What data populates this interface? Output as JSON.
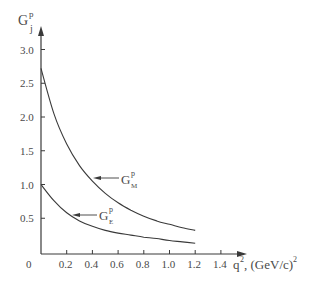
{
  "chart_data": {
    "type": "line",
    "title": "",
    "ylabel": "G_j^p",
    "ylabel_parts": {
      "base": "G",
      "sup": "p",
      "sub": "j"
    },
    "xlabel": "q², (GeV/c)²",
    "xlabel_parts": {
      "main": "q",
      "sup1": "2",
      "rest": ", (GeV/c)",
      "sup2": "2"
    },
    "xlim": [
      0,
      1.5
    ],
    "ylim": [
      0,
      3.2
    ],
    "grid": false,
    "legend": "inline arrow labels",
    "x_ticks": [
      "0",
      "0.2",
      "0.4",
      "0.6",
      "0.8",
      "1.0",
      "1.2",
      "1.4"
    ],
    "y_ticks": [
      "0.5",
      "1.0",
      "1.5",
      "2.0",
      "2.5",
      "3.0"
    ],
    "series": [
      {
        "name": "G_M^p",
        "label_parts": {
          "base": "G",
          "sup": "p",
          "sub": "M"
        },
        "x": [
          0,
          0.1,
          0.2,
          0.3,
          0.4,
          0.5,
          0.6,
          0.7,
          0.8,
          0.9,
          1.0,
          1.1,
          1.2
        ],
        "values": [
          2.72,
          2.05,
          1.6,
          1.28,
          1.05,
          0.87,
          0.73,
          0.62,
          0.53,
          0.46,
          0.41,
          0.36,
          0.32
        ]
      },
      {
        "name": "G_E^p",
        "label_parts": {
          "base": "G",
          "sup": "p",
          "sub": "E"
        },
        "x": [
          0,
          0.1,
          0.2,
          0.3,
          0.4,
          0.5,
          0.6,
          0.7,
          0.8,
          0.9,
          1.0,
          1.1,
          1.2
        ],
        "values": [
          1.0,
          0.76,
          0.58,
          0.46,
          0.38,
          0.32,
          0.28,
          0.25,
          0.22,
          0.2,
          0.17,
          0.15,
          0.13
        ]
      }
    ]
  }
}
